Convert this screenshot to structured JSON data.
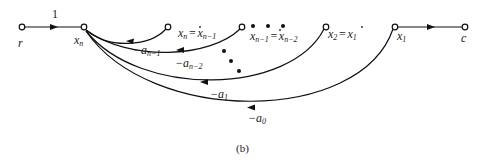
{
  "diagram": {
    "type": "signal-flow-graph",
    "caption": "(b)",
    "forward_gain": "1",
    "nodes": {
      "r": "r",
      "xn": "x",
      "xn_sub": "n",
      "c": "c",
      "x1": "x",
      "x1_sub": "1",
      "node_n": {
        "lhs": "x",
        "lhs_sub": "n",
        "eq": "=",
        "rhs": "x",
        "rhs_sub": "n−1"
      },
      "node_n1": {
        "lhs": "x",
        "lhs_sub": "n−1",
        "eq": "=",
        "rhs": "x",
        "rhs_sub": "n−2"
      },
      "node_2": {
        "lhs": "x",
        "lhs_sub": "2",
        "eq": "=",
        "rhs": "x",
        "rhs_sub": "1"
      }
    },
    "branches": [
      {
        "label": "−a",
        "sub": "n−1"
      },
      {
        "label": "−a",
        "sub": "n−2"
      },
      {
        "label": "−a",
        "sub": "1"
      },
      {
        "label": "−a",
        "sub": "0"
      }
    ]
  }
}
